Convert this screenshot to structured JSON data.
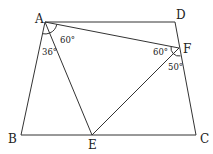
{
  "diagram": {
    "type": "geometry",
    "points": {
      "A": {
        "label": "A",
        "x": 45,
        "y": 22
      },
      "D": {
        "label": "D",
        "x": 175,
        "y": 22
      },
      "F": {
        "label": "F",
        "x": 179,
        "y": 48
      },
      "B": {
        "label": "B",
        "x": 21,
        "y": 135
      },
      "E": {
        "label": "E",
        "x": 92,
        "y": 135
      },
      "C": {
        "label": "C",
        "x": 196,
        "y": 135
      }
    },
    "segments": [
      "AD",
      "DC",
      "CB",
      "BA",
      "AF",
      "AE",
      "EF"
    ],
    "angles": [
      {
        "at": "A",
        "between": "AE,AF",
        "label": "60°"
      },
      {
        "at": "A",
        "between": "AB,AE",
        "label": "36°"
      },
      {
        "at": "F",
        "between": "FA,FE",
        "label": "60°"
      },
      {
        "at": "F",
        "between": "FE,FC",
        "label": "50°"
      }
    ],
    "colors": {
      "line": "#333333",
      "text": "#222222"
    }
  }
}
